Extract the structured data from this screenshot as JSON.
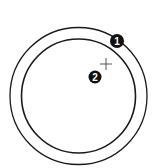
{
  "diagram": {
    "colors": {
      "stroke": "#1a1a1a",
      "marker_fill": "#111111",
      "marker_text": "#ffffff",
      "background": "#ffffff"
    },
    "outer_circle": {
      "cx": 78.5,
      "cy": 96,
      "r": 68.5
    },
    "inner_circle": {
      "cx": 78.5,
      "cy": 96,
      "r": 57
    },
    "crosshair": {
      "cx": 106,
      "cy": 64,
      "arm": 6
    },
    "markers": [
      {
        "label": "1",
        "cx": 117,
        "cy": 41,
        "r": 7
      },
      {
        "label": "2",
        "cx": 95,
        "cy": 77,
        "r": 6.5
      }
    ]
  }
}
